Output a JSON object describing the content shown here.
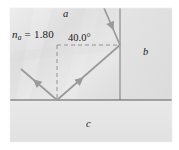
{
  "figure": {
    "type": "optics-ray-diagram",
    "canvas": {
      "width": 179,
      "height": 150
    },
    "background_color": "#ffffff",
    "labels": {
      "index_symbol": "n",
      "index_subscript": "a",
      "index_equals": " = ",
      "index_value": "1.80",
      "angle": "40.0°",
      "medium_a": "a",
      "medium_b": "b",
      "medium_c": "c"
    },
    "regions": {
      "medium_a_fill": "#e2e2e2",
      "medium_b_fill": "#e0e0e0",
      "medium_c_fill": "#e6e6e6",
      "boundary_color": "#6e6e6e"
    },
    "rays": {
      "color": "#8f8f8f",
      "incident_label": "incident-ray",
      "internal_label": "internal-ray",
      "outgoing_label": "outgoing-ray",
      "normal_color": "#8a8a8a"
    },
    "geometry": {
      "vertex_right_x": 120,
      "vertex_right_y": 45,
      "vertex_bottom_x": 57,
      "vertex_bottom_y": 100,
      "vertical_boundary_x": 120,
      "horizontal_boundary_y": 100
    }
  }
}
